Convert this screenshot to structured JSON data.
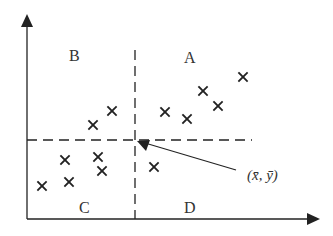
{
  "diagram": {
    "type": "scatter-quadrants",
    "colors": {
      "ink": "#222222",
      "background": "#ffffff"
    },
    "axes": {
      "origin": [
        27,
        219
      ],
      "y_axis_top": 18,
      "x_axis_right": 318
    },
    "mean_lines": {
      "x_mean_px": 135,
      "y_mean_px": 140,
      "h_line_end": 250
    },
    "quadrant_labels": {
      "A": "A",
      "B": "B",
      "C": "C",
      "D": "D"
    },
    "mean_label": "(x̄, ȳ)",
    "points": [
      {
        "x": 243,
        "y": 77,
        "quadrant": "A"
      },
      {
        "x": 203,
        "y": 91,
        "quadrant": "A"
      },
      {
        "x": 218,
        "y": 106,
        "quadrant": "A"
      },
      {
        "x": 165,
        "y": 112,
        "quadrant": "A"
      },
      {
        "x": 187,
        "y": 119,
        "quadrant": "A"
      },
      {
        "x": 112,
        "y": 111,
        "quadrant": "B"
      },
      {
        "x": 93,
        "y": 125,
        "quadrant": "B"
      },
      {
        "x": 65,
        "y": 160,
        "quadrant": "C"
      },
      {
        "x": 98,
        "y": 157,
        "quadrant": "C"
      },
      {
        "x": 102,
        "y": 171,
        "quadrant": "C"
      },
      {
        "x": 69,
        "y": 182,
        "quadrant": "C"
      },
      {
        "x": 42,
        "y": 186,
        "quadrant": "C"
      },
      {
        "x": 154,
        "y": 167,
        "quadrant": "D"
      }
    ]
  }
}
